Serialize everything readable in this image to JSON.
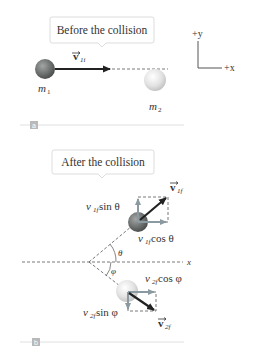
{
  "panels": [
    {
      "id": "a",
      "callout": "Before the collision",
      "mass1_label": "m",
      "mass1_sub": "1",
      "mass2_label": "m",
      "mass2_sub": "2",
      "velocity_label": "v",
      "velocity_sub": "1i",
      "tag": "a"
    },
    {
      "id": "b",
      "callout": "After the collision",
      "v1f_label": "v",
      "v1f_sub": "1f",
      "v1f_sin_label": "v",
      "v1f_sin_sub": "1f",
      "v1f_sin_text": " sin θ",
      "v1f_cos_label": "v",
      "v1f_cos_sub": "1f",
      "v1f_cos_text": " cos θ",
      "v2f_label": "v",
      "v2f_sub": "2f",
      "v2f_cos_label": "v",
      "v2f_cos_sub": "2f",
      "v2f_cos_text": " cos φ",
      "v2f_sin_label": "v",
      "v2f_sin_sub": "2f",
      "v2f_sin_text": " sin φ",
      "theta": "θ",
      "phi": "φ",
      "x_axis": "x",
      "tag": "b"
    }
  ],
  "axes": {
    "y_label": "+y",
    "x_label": "+x"
  },
  "colors": {
    "arrow": "#222222",
    "component_arrow": "#8a9aa0",
    "sphere1": "#6f7372",
    "sphere2": "#e6e6e6",
    "dashed": "#555555",
    "tag_bg": "#b9b9b9",
    "rule": "#dcdcdc"
  }
}
